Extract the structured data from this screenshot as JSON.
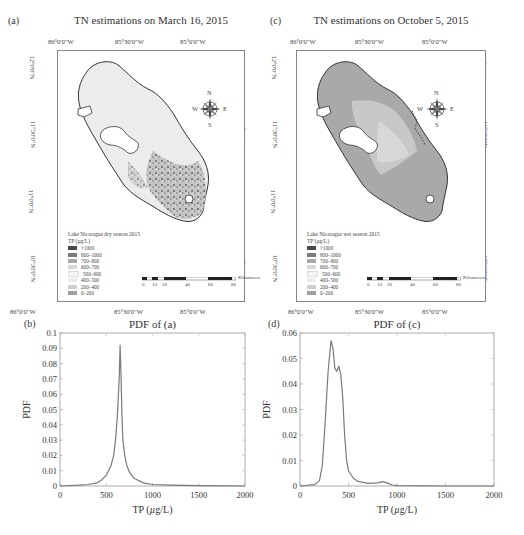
{
  "panels": {
    "a": {
      "label": "(a)",
      "title": "TN estimations on March 16, 2015",
      "lon_ticks": [
        "86°0'0\"W",
        "85°30'0\"W",
        "85°0'0\"W"
      ],
      "lat_ticks": [
        "12°0'0\"N",
        "11°30'0\"N",
        "11°0'0\"N",
        "10°30'0\"N"
      ],
      "legend_title_1": "Lake Nicaragua dry season 2015",
      "legend_title_2": "TP (µg/L)",
      "scale_unit": "Kilometers",
      "scale_ticks": [
        "0",
        "10",
        "20",
        "40",
        "60",
        "80"
      ],
      "compass": {
        "n": "N",
        "s": "S",
        "e": "E",
        "w": "W"
      }
    },
    "c": {
      "label": "(c)",
      "title": "TN estimations on October 5, 2015",
      "lon_ticks": [
        "86°0'0\"W",
        "85°30'0\"W",
        "85°0'0\"W"
      ],
      "lat_ticks": [
        "12°0'0\"N",
        "11°30'0\"N",
        "11°0'0\"N",
        "10°30'0\"N"
      ],
      "legend_title_1": "Lake Nicaragua wet season 2015",
      "legend_title_2": "TP (µg/L)",
      "scale_unit": "Kilometers",
      "scale_ticks": [
        "0",
        "10",
        "20",
        "40",
        "60",
        "80"
      ],
      "compass": {
        "n": "N",
        "s": "S",
        "e": "E",
        "w": "W"
      }
    },
    "b": {
      "label": "(b)",
      "title": "PDF of (a)"
    },
    "d": {
      "label": "(d)",
      "title": "PDF of (c)"
    }
  },
  "legend_classes": [
    {
      "label": ">1000",
      "color": "#4a4a4a"
    },
    {
      "label": "800–1000",
      "color": "#7a7a7a"
    },
    {
      "label": "700–800",
      "color": "#a8a8a8"
    },
    {
      "label": "600–700",
      "color": "#d8d8d8"
    },
    {
      "label": "500–600",
      "color": "#f4f4f4"
    },
    {
      "label": "400–500",
      "color": "#ececec"
    },
    {
      "label": "200–400",
      "color": "#cfcfcf"
    },
    {
      "label": "0–200",
      "color": "#a0a0a0"
    }
  ],
  "chart_data": [
    {
      "type": "line",
      "title": "PDF of (a)",
      "panel": "(b)",
      "xlabel": "TP (µg/L)",
      "ylabel": "PDF",
      "xlim": [
        0,
        2000
      ],
      "ylim": [
        0,
        0.1
      ],
      "xticks": [
        "0",
        "500",
        "1000",
        "1500",
        "2000"
      ],
      "yticks": [
        "0",
        "0.01",
        "0.02",
        "0.03",
        "0.04",
        "0.05",
        "0.06",
        "0.07",
        "0.08",
        "0.09",
        "0.1"
      ],
      "grid": false,
      "series": [
        {
          "name": "PDF",
          "x": [
            0,
            200,
            300,
            400,
            450,
            500,
            550,
            580,
            600,
            620,
            640,
            650,
            660,
            670,
            680,
            700,
            720,
            750,
            800,
            900,
            1000,
            1200,
            1500,
            2000
          ],
          "y": [
            0,
            0.0005,
            0.001,
            0.002,
            0.004,
            0.007,
            0.013,
            0.02,
            0.03,
            0.045,
            0.07,
            0.092,
            0.07,
            0.045,
            0.03,
            0.02,
            0.014,
            0.009,
            0.005,
            0.002,
            0.001,
            0.0005,
            0.0002,
            0
          ]
        }
      ]
    },
    {
      "type": "line",
      "title": "PDF of (c)",
      "panel": "(d)",
      "xlabel": "TP (µg/L)",
      "ylabel": "PDF",
      "xlim": [
        0,
        2000
      ],
      "ylim": [
        0,
        0.06
      ],
      "xticks": [
        "0",
        "500",
        "1000",
        "1500",
        "2000"
      ],
      "yticks": [
        "0",
        "0.01",
        "0.02",
        "0.03",
        "0.04",
        "0.05",
        "0.06"
      ],
      "grid": false,
      "series": [
        {
          "name": "PDF",
          "x": [
            0,
            150,
            200,
            230,
            260,
            290,
            320,
            340,
            360,
            380,
            400,
            420,
            440,
            460,
            480,
            500,
            550,
            600,
            700,
            800,
            850,
            900,
            950,
            1000,
            1500,
            2000
          ],
          "y": [
            0,
            0.0005,
            0.002,
            0.008,
            0.025,
            0.045,
            0.057,
            0.054,
            0.046,
            0.045,
            0.047,
            0.044,
            0.035,
            0.02,
            0.01,
            0.006,
            0.003,
            0.0018,
            0.001,
            0.0012,
            0.0017,
            0.0012,
            0.0004,
            0.0001,
            0,
            0
          ]
        }
      ]
    }
  ]
}
